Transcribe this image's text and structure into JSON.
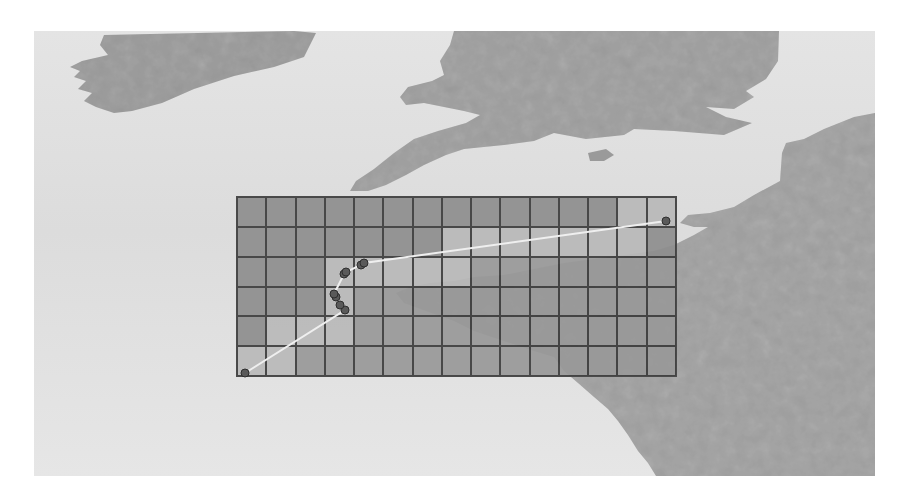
{
  "map": {
    "region_shown": [
      "Ireland (south)",
      "Wales",
      "Southern England",
      "Isle of Wight",
      "Brittany",
      "Normandy",
      "Northern France"
    ],
    "colors": {
      "sea": "#dedede",
      "land": "#9c9c9c",
      "land_light": "#a8a8a8",
      "grid_line": "#3c3c3c",
      "cell_dark": "#8e8e8e",
      "cell_medium": "#999999",
      "cell_light": "#b9b9b9",
      "path_line": "#efefef",
      "marker_fill": "#5a5a5a",
      "marker_stroke": "#2e2e2e"
    }
  },
  "grid": {
    "columns": 15,
    "rows": 6,
    "cells": [
      [
        "d",
        "d",
        "d",
        "d",
        "d",
        "d",
        "d",
        "d",
        "d",
        "d",
        "d",
        "d",
        "d",
        "l",
        "l"
      ],
      [
        "d",
        "d",
        "d",
        "d",
        "d",
        "d",
        "d",
        "l",
        "l",
        "l",
        "l",
        "l",
        "l",
        "l",
        "d"
      ],
      [
        "d",
        "d",
        "d",
        "l",
        "l",
        "l",
        "l",
        "l",
        "m",
        "m",
        "m",
        "m",
        "m",
        "m",
        "m"
      ],
      [
        "d",
        "d",
        "d",
        "l",
        "m",
        "m",
        "m",
        "m",
        "m",
        "m",
        "m",
        "m",
        "m",
        "m",
        "m"
      ],
      [
        "d",
        "l",
        "l",
        "l",
        "m",
        "m",
        "m",
        "m",
        "m",
        "m",
        "m",
        "m",
        "m",
        "m",
        "m"
      ],
      [
        "l",
        "l",
        "m",
        "m",
        "m",
        "m",
        "m",
        "m",
        "m",
        "m",
        "m",
        "m",
        "m",
        "m",
        "m"
      ]
    ]
  },
  "track": {
    "points": [
      {
        "x": 245,
        "y": 373
      },
      {
        "x": 345,
        "y": 310
      },
      {
        "x": 340,
        "y": 305
      },
      {
        "x": 336,
        "y": 297
      },
      {
        "x": 334,
        "y": 294
      },
      {
        "x": 344,
        "y": 274
      },
      {
        "x": 346,
        "y": 272
      },
      {
        "x": 361,
        "y": 265
      },
      {
        "x": 364,
        "y": 263
      },
      {
        "x": 666,
        "y": 221
      }
    ],
    "marker_count": 10
  }
}
